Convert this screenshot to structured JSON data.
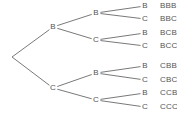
{
  "diagram": {
    "type": "probability-tree",
    "colors": {
      "line": "#6a6a6a",
      "text": "#555555",
      "background": "#ffffff"
    },
    "root": {
      "x": 12,
      "y": 57
    },
    "level1": [
      {
        "label": "B",
        "x": 53,
        "y": 27
      },
      {
        "label": "C",
        "x": 53,
        "y": 88
      }
    ],
    "level2": [
      {
        "label": "B",
        "x": 96,
        "y": 13,
        "parent": 0
      },
      {
        "label": "C",
        "x": 96,
        "y": 40,
        "parent": 0
      },
      {
        "label": "B",
        "x": 96,
        "y": 73,
        "parent": 1
      },
      {
        "label": "C",
        "x": 96,
        "y": 100,
        "parent": 1
      }
    ],
    "level3": [
      {
        "label": "B",
        "x": 145,
        "y": 6,
        "parent": 0
      },
      {
        "label": "C",
        "x": 145,
        "y": 19,
        "parent": 0
      },
      {
        "label": "B",
        "x": 145,
        "y": 33,
        "parent": 1
      },
      {
        "label": "C",
        "x": 145,
        "y": 46,
        "parent": 1
      },
      {
        "label": "B",
        "x": 145,
        "y": 66,
        "parent": 2
      },
      {
        "label": "C",
        "x": 145,
        "y": 80,
        "parent": 2
      },
      {
        "label": "B",
        "x": 145,
        "y": 93,
        "parent": 3
      },
      {
        "label": "C",
        "x": 145,
        "y": 107,
        "parent": 3
      }
    ],
    "outcomes": [
      {
        "label": "BBB",
        "x": 160,
        "y": 6
      },
      {
        "label": "BBC",
        "x": 160,
        "y": 19
      },
      {
        "label": "BCB",
        "x": 160,
        "y": 33
      },
      {
        "label": "BCC",
        "x": 160,
        "y": 46
      },
      {
        "label": "CBB",
        "x": 160,
        "y": 66
      },
      {
        "label": "CBC",
        "x": 160,
        "y": 80
      },
      {
        "label": "CCB",
        "x": 160,
        "y": 93
      },
      {
        "label": "CCC",
        "x": 160,
        "y": 107
      }
    ]
  }
}
